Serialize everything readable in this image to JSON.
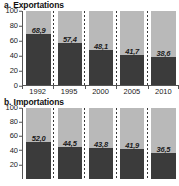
{
  "chart_data": [
    {
      "type": "bar",
      "title": "a. Exportations",
      "panel_id": "a",
      "xlabel": "",
      "ylabel": "",
      "ylim": [
        0,
        100
      ],
      "yticks": [
        100,
        80,
        60,
        40,
        20,
        0
      ],
      "categories": [
        "1992",
        "1995",
        "2000",
        "2005",
        "2010"
      ],
      "values": [
        68.9,
        57.4,
        48.1,
        41.7,
        38.6
      ],
      "value_labels": [
        "68,9",
        "57,4",
        "48,1",
        "41,7",
        "38,6"
      ],
      "stacked_remainder": [
        31.1,
        42.6,
        51.9,
        58.3,
        61.4
      ],
      "grid": false,
      "legend": "none",
      "series": [
        {
          "name": "part-basse",
          "values": [
            68.9,
            57.4,
            48.1,
            41.7,
            38.6
          ],
          "color": "#3b3b3b"
        },
        {
          "name": "part-haute",
          "values": [
            31.1,
            42.6,
            51.9,
            58.3,
            61.4
          ],
          "color": "#b9b9b9"
        }
      ]
    },
    {
      "type": "bar",
      "title": "b. Importations",
      "panel_id": "b",
      "xlabel": "",
      "ylabel": "",
      "ylim": [
        0,
        100
      ],
      "yticks": [
        100,
        80,
        60,
        40,
        20
      ],
      "categories": [
        "1992",
        "1995",
        "2000",
        "2005",
        "2010"
      ],
      "values": [
        52.0,
        44.5,
        43.8,
        41.9,
        36.5
      ],
      "value_labels": [
        "52,0",
        "44,5",
        "43,8",
        "41,9",
        "36,5"
      ],
      "stacked_remainder": [
        48.0,
        55.5,
        56.2,
        58.1,
        63.5
      ],
      "grid": false,
      "legend": "none",
      "cropped_bottom": true,
      "series": [
        {
          "name": "part-basse",
          "values": [
            52.0,
            44.5,
            43.8,
            41.9,
            36.5
          ],
          "color": "#3b3b3b"
        },
        {
          "name": "part-haute",
          "values": [
            48.0,
            55.5,
            56.2,
            58.1,
            63.5
          ],
          "color": "#b9b9b9"
        }
      ]
    }
  ],
  "colors": {
    "bar_dark": "#3b3b3b",
    "bar_light": "#b9b9b9",
    "axis": "#555555",
    "text": "#1a1a1a",
    "background": "#ffffff"
  }
}
